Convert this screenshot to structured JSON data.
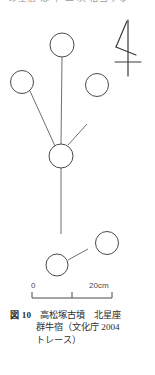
{
  "top_partial_text": {
    "text": "の星宿   は   十   二   次   相当する"
  },
  "figure": {
    "kanji_label": "牛",
    "stars": [
      {
        "id": "star-top",
        "cx": 62,
        "cy": 33,
        "r": 12
      },
      {
        "id": "star-left",
        "cx": 22,
        "cy": 70,
        "r": 11.5
      },
      {
        "id": "star-right",
        "cx": 97,
        "cy": 73,
        "r": 11.5
      },
      {
        "id": "star-hub",
        "cx": 61,
        "cy": 144,
        "r": 12
      },
      {
        "id": "star-lower-right",
        "cx": 107,
        "cy": 231,
        "r": 11.5
      },
      {
        "id": "star-lower-left",
        "cx": 57,
        "cy": 253,
        "r": 11
      }
    ],
    "links": [
      {
        "id": "link-top-hub",
        "from": "star-top",
        "to": "star-hub"
      },
      {
        "id": "link-left-hub",
        "from": "star-left",
        "to": "star-hub"
      },
      {
        "id": "link-hub-upper-right",
        "from": "star-hub",
        "to": "branch-upper-right"
      },
      {
        "id": "link-hub-tail",
        "from": "star-hub",
        "to": "tail-end"
      },
      {
        "id": "link-lower-pair",
        "from": "star-lower-left",
        "to": "star-lower-right"
      }
    ],
    "stroke_color": "#4a4a4a",
    "line_color": "#6a6a6a"
  },
  "scale": {
    "left_label": "0",
    "right_label": "20cm",
    "ticks": 2,
    "units": "cm",
    "max_value": 20
  },
  "caption": {
    "figure_number": "図 10",
    "line1_text": "高松塚古墳　北星座",
    "line2": "群牛宿（文化庁 2004",
    "line3": "トレース）"
  }
}
